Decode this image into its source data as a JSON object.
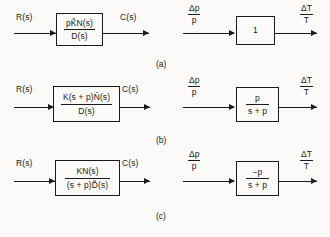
{
  "figure": {
    "background_color": "#fbfaf8",
    "ink_color": "#1a1a1a",
    "rows": [
      {
        "caption": "(a)",
        "left": {
          "input_label": "R(s)",
          "output_label": "C(s)",
          "transfer_function": {
            "kind": "fraction",
            "numerator": "pK̃N(s)",
            "denominator": "D(s)"
          }
        },
        "right": {
          "input_numerator": "Δp",
          "input_denominator": "p",
          "output_numerator": "ΔT",
          "output_denominator": "T",
          "transfer_function": {
            "kind": "plain",
            "value": "1"
          }
        }
      },
      {
        "caption": "(b)",
        "left": {
          "input_label": "R(s)",
          "output_label": "C(s)",
          "transfer_function": {
            "kind": "fraction",
            "numerator": "K(s + p)Ñ(s)",
            "denominator": "D(s)"
          }
        },
        "right": {
          "input_numerator": "Δp",
          "input_denominator": "p",
          "output_numerator": "ΔT",
          "output_denominator": "T",
          "transfer_function": {
            "kind": "fraction",
            "numerator": "p",
            "denominator": "s + p"
          }
        }
      },
      {
        "caption": "(c)",
        "left": {
          "input_label": "R(s)",
          "output_label": "C(s)",
          "transfer_function": {
            "kind": "fraction",
            "numerator": "KN(s)",
            "denominator": "(s + p)D̃(s)"
          }
        },
        "right": {
          "input_numerator": "Δp",
          "input_denominator": "p",
          "output_numerator": "ΔT",
          "output_denominator": "T",
          "transfer_function": {
            "kind": "fraction",
            "numerator": "−p",
            "denominator": "s + p"
          }
        }
      }
    ]
  }
}
